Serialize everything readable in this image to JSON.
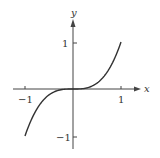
{
  "chart_data": {
    "type": "line",
    "title": "",
    "function": "y = x^3",
    "xlabel": "x",
    "ylabel": "y",
    "xlim": [
      -1,
      1
    ],
    "ylim": [
      -1,
      1
    ],
    "x_ticks": [
      {
        "value": -1,
        "label": "-1"
      },
      {
        "value": 1,
        "label": "1"
      }
    ],
    "y_ticks": [
      {
        "value": 1,
        "label": "1"
      },
      {
        "value": -1,
        "label": "-1"
      }
    ],
    "grid": false,
    "legend": null,
    "series": [
      {
        "name": "x^3",
        "x": [
          -1,
          -0.75,
          -0.5,
          -0.25,
          0,
          0.25,
          0.5,
          0.75,
          1
        ],
        "y": [
          -1,
          -0.421875,
          -0.125,
          -0.015625,
          0,
          0.015625,
          0.125,
          0.421875,
          1
        ]
      }
    ]
  },
  "labels": {
    "x_axis": "x",
    "y_axis": "y",
    "x_tick_neg": "−1",
    "x_tick_pos": "1",
    "y_tick_pos": "1",
    "y_tick_neg": "−1"
  },
  "colors": {
    "axis": "#444444",
    "curve": "#333333",
    "text": "#333333"
  }
}
